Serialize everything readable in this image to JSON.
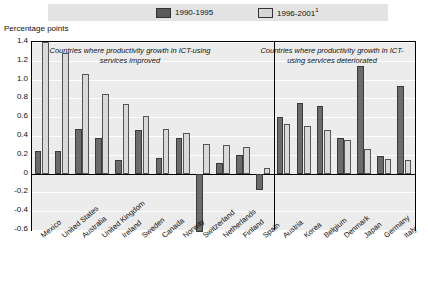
{
  "legend": {
    "items": [
      {
        "label": "1990-1995",
        "swatch": "dark-swatch",
        "color": "#5a5a5a"
      },
      {
        "label": "1996-2001",
        "sup": "1",
        "swatch": "light-swatch",
        "color": "#d6d6d6"
      }
    ]
  },
  "axis_title": "Percentage points",
  "captions": {
    "left": "Countries where productivity growth in ICT-using services improved",
    "right": "Countries where productivity growth in ICT-using services deteriorated"
  },
  "chart_data": {
    "type": "bar",
    "title": "",
    "subtitle": "",
    "xlabel": "",
    "ylabel": "Percentage points",
    "ylim": [
      -0.6,
      1.4
    ],
    "yticks": [
      "1.4",
      "1.2",
      "1.0",
      "0.8",
      "0.6",
      "0.4",
      "0.2",
      "0",
      "-0.2",
      "-0.4",
      "-0.6"
    ],
    "ytick_values": [
      1.4,
      1.2,
      1.0,
      0.8,
      0.6,
      0.4,
      0.2,
      0,
      -0.2,
      -0.4,
      -0.6
    ],
    "grid": true,
    "legend_position": "top",
    "categories": [
      "Mexico",
      "United States",
      "Australia",
      "United Kingdom",
      "Ireland",
      "Sweden",
      "Canada",
      "Norway",
      "Switzerland",
      "Netherlands",
      "Finland",
      "Spain",
      "Austria",
      "Korea",
      "Belgium",
      "Denmark",
      "Japan",
      "Germany",
      "Italy"
    ],
    "series": [
      {
        "name": "1990-1995",
        "color": "#6b6b6b",
        "values": [
          0.24,
          0.24,
          0.47,
          0.38,
          0.15,
          0.46,
          0.17,
          0.38,
          -0.62,
          0.11,
          0.2,
          -0.17,
          0.6,
          0.75,
          0.72,
          0.38,
          1.15,
          0.19,
          0.93
        ]
      },
      {
        "name": "1996-2001",
        "color": "#d9d9d9",
        "values": [
          1.4,
          1.28,
          1.06,
          0.85,
          0.74,
          0.61,
          0.47,
          0.43,
          0.31,
          0.3,
          0.28,
          0.06,
          0.53,
          0.51,
          0.46,
          0.36,
          0.26,
          0.16,
          0.14
        ]
      }
    ],
    "panel_split_after_category": "Spain",
    "annotations": [
      "Countries where productivity growth in ICT-using services improved",
      "Countries where productivity growth in ICT-using services deteriorated"
    ]
  }
}
